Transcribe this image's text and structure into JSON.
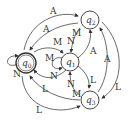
{
  "diagram": {
    "type": "state-machine",
    "states": [
      {
        "id": "q0",
        "name": "q",
        "sub": "0",
        "accepting": true
      },
      {
        "id": "q1",
        "name": "q",
        "sub": "1",
        "accepting": false
      },
      {
        "id": "q2",
        "name": "q",
        "sub": "2",
        "accepting": false
      },
      {
        "id": "q3",
        "name": "q",
        "sub": "3",
        "accepting": false
      }
    ],
    "transitions": [
      {
        "from": "q0",
        "to": "q0",
        "label": "N"
      },
      {
        "from": "q0",
        "to": "q2",
        "label": "A"
      },
      {
        "from": "q2",
        "to": "q0",
        "label": "A"
      },
      {
        "from": "q0",
        "to": "q1",
        "label": "M"
      },
      {
        "from": "q1",
        "to": "q0",
        "label": "N"
      },
      {
        "from": "q1",
        "to": "q1",
        "label": "M"
      },
      {
        "from": "q2",
        "to": "q1",
        "label": "M"
      },
      {
        "from": "q2",
        "to": "q1",
        "label": "N"
      },
      {
        "from": "q1",
        "to": "q2",
        "label": "A"
      },
      {
        "from": "q1",
        "to": "q3",
        "label": "L"
      },
      {
        "from": "q3",
        "to": "q1",
        "label": "M"
      },
      {
        "from": "q3",
        "to": "q1",
        "label": "N"
      },
      {
        "from": "q3",
        "to": "q0",
        "label": "L"
      },
      {
        "from": "q0",
        "to": "q3",
        "label": "L"
      },
      {
        "from": "q3",
        "to": "q2",
        "label": "A"
      },
      {
        "from": "q2",
        "to": "q3",
        "label": "L"
      }
    ]
  }
}
